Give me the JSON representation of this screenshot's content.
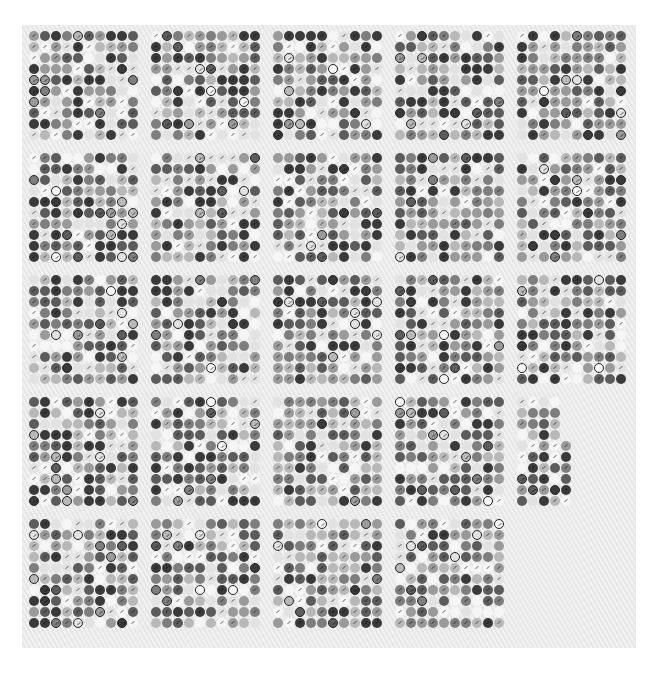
{
  "scene": {
    "description": "Photograph of a bottle-cap collection mounted in grid panels on a light textured board, grayscale",
    "board_color": "#ececec",
    "cap_shades": [
      "#3a3a3a",
      "#5c5c5c",
      "#7e7e7e",
      "#9a9a9a",
      "#b8b8b8",
      "#e2e2e2",
      "#f6f6f6"
    ],
    "grid_cols_per_panel": 10,
    "grid_rows_per_panel": 10,
    "panel_size": 110,
    "panel_pitch": 122,
    "origin_x": 28,
    "origin_y": 30
  },
  "panels": [
    {
      "row": 0,
      "col": 0
    },
    {
      "row": 0,
      "col": 1
    },
    {
      "row": 0,
      "col": 2
    },
    {
      "row": 0,
      "col": 3
    },
    {
      "row": 0,
      "col": 4
    },
    {
      "row": 1,
      "col": 0
    },
    {
      "row": 1,
      "col": 1
    },
    {
      "row": 1,
      "col": 2
    },
    {
      "row": 1,
      "col": 3
    },
    {
      "row": 1,
      "col": 4
    },
    {
      "row": 2,
      "col": 0
    },
    {
      "row": 2,
      "col": 1
    },
    {
      "row": 2,
      "col": 2
    },
    {
      "row": 2,
      "col": 3
    },
    {
      "row": 2,
      "col": 4
    },
    {
      "row": 3,
      "col": 0
    },
    {
      "row": 3,
      "col": 1
    },
    {
      "row": 3,
      "col": 2
    },
    {
      "row": 3,
      "col": 3
    },
    {
      "row": 3,
      "col": 4,
      "partial": true,
      "cols": 5,
      "rows_short_cols": 4
    },
    {
      "row": 4,
      "col": 0
    },
    {
      "row": 4,
      "col": 1
    },
    {
      "row": 4,
      "col": 2
    },
    {
      "row": 4,
      "col": 3
    }
  ]
}
